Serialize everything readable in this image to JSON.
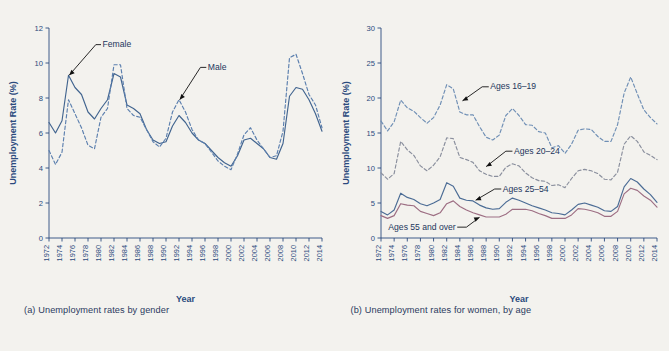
{
  "figure": {
    "background": "#f3f2ee",
    "axis_color": "#2b4a7d"
  },
  "panel_a": {
    "caption": "(a) Unemployment rates by gender",
    "ylabel": "Unemployment Rate (%)",
    "xlabel": "Year",
    "label_female": "Female",
    "label_male": "Male"
  },
  "panel_b": {
    "caption": "(b) Unemployment rates for women, by age",
    "ylabel": "Unemployment Rate (%)",
    "xlabel": "Year",
    "label_16_19": "Ages 16–19",
    "label_20_24": "Ages 20–24",
    "label_25_54": "Ages 25–54",
    "label_55_over": "Ages 55 and over"
  },
  "chart_data": [
    {
      "id": "panel_a",
      "type": "line",
      "title": "(a) Unemployment rates by gender",
      "xlabel": "Year",
      "ylabel": "Unemployment Rate (%)",
      "xlim": [
        1972,
        2014
      ],
      "ylim": [
        0,
        12
      ],
      "yticks": [
        0,
        2,
        4,
        6,
        8,
        10,
        12
      ],
      "xticks": [
        1972,
        1974,
        1976,
        1978,
        1980,
        1982,
        1984,
        1986,
        1988,
        1990,
        1992,
        1994,
        1996,
        1998,
        2000,
        2002,
        2004,
        2006,
        2008,
        2010,
        2012,
        2014
      ],
      "grid": false,
      "legend": "inline-annotations",
      "x": [
        1972,
        1973,
        1974,
        1975,
        1976,
        1977,
        1978,
        1979,
        1980,
        1981,
        1982,
        1983,
        1984,
        1985,
        1986,
        1987,
        1988,
        1989,
        1990,
        1991,
        1992,
        1993,
        1994,
        1995,
        1996,
        1997,
        1998,
        1999,
        2000,
        2001,
        2002,
        2003,
        2004,
        2005,
        2006,
        2007,
        2008,
        2009,
        2010,
        2011,
        2012,
        2013,
        2014
      ],
      "series": [
        {
          "name": "Female",
          "style": "solid",
          "color": "#41648f",
          "values": [
            6.6,
            6.0,
            6.7,
            9.3,
            8.6,
            8.2,
            7.2,
            6.8,
            7.4,
            7.9,
            9.4,
            9.2,
            7.6,
            7.4,
            7.1,
            6.2,
            5.6,
            5.4,
            5.5,
            6.4,
            7.0,
            6.6,
            6.0,
            5.6,
            5.4,
            5.0,
            4.6,
            4.3,
            4.1,
            4.7,
            5.6,
            5.7,
            5.4,
            5.1,
            4.6,
            4.5,
            5.4,
            8.1,
            8.6,
            8.5,
            7.9,
            7.1,
            6.1
          ]
        },
        {
          "name": "Male",
          "style": "dashed",
          "color": "#5b7fae",
          "values": [
            5.0,
            4.2,
            4.9,
            7.9,
            7.1,
            6.3,
            5.3,
            5.1,
            6.9,
            7.4,
            9.9,
            9.9,
            7.4,
            7.0,
            6.9,
            6.2,
            5.5,
            5.2,
            5.7,
            7.2,
            7.9,
            7.2,
            6.2,
            5.6,
            5.4,
            4.9,
            4.4,
            4.1,
            3.9,
            4.8,
            5.9,
            6.3,
            5.6,
            5.1,
            4.6,
            4.7,
            6.1,
            10.3,
            10.5,
            9.4,
            8.2,
            7.6,
            6.3
          ]
        }
      ]
    },
    {
      "id": "panel_b",
      "type": "line",
      "title": "(b) Unemployment rates for women, by age",
      "xlabel": "Year",
      "ylabel": "Unemployment Rate (%)",
      "xlim": [
        1972,
        2014
      ],
      "ylim": [
        0,
        30
      ],
      "yticks": [
        0,
        5,
        10,
        15,
        20,
        25,
        30
      ],
      "xticks": [
        1972,
        1974,
        1976,
        1978,
        1980,
        1982,
        1984,
        1986,
        1988,
        1990,
        1992,
        1994,
        1996,
        1998,
        2000,
        2002,
        2004,
        2006,
        2008,
        2010,
        2012,
        2014
      ],
      "grid": false,
      "legend": "inline-annotations",
      "x": [
        1972,
        1973,
        1974,
        1975,
        1976,
        1977,
        1978,
        1979,
        1980,
        1981,
        1982,
        1983,
        1984,
        1985,
        1986,
        1987,
        1988,
        1989,
        1990,
        1991,
        1992,
        1993,
        1994,
        1995,
        1996,
        1997,
        1998,
        1999,
        2000,
        2001,
        2002,
        2003,
        2004,
        2005,
        2006,
        2007,
        2008,
        2009,
        2010,
        2011,
        2012,
        2013,
        2014
      ],
      "series": [
        {
          "name": "Ages 16–19",
          "style": "dashed",
          "color": "#6f8fb5",
          "values": [
            16.7,
            15.3,
            16.6,
            19.7,
            18.6,
            18.1,
            17.2,
            16.4,
            17.2,
            19.0,
            21.9,
            21.3,
            18.0,
            17.6,
            17.6,
            15.9,
            14.4,
            14.0,
            14.7,
            17.5,
            18.5,
            17.5,
            16.2,
            16.1,
            15.2,
            15.0,
            12.9,
            13.2,
            12.1,
            13.4,
            15.4,
            15.6,
            15.5,
            14.5,
            13.8,
            13.8,
            16.2,
            20.7,
            23.0,
            20.6,
            18.3,
            17.2,
            16.3
          ]
        },
        {
          "name": "Ages 20–24",
          "style": "dashed",
          "color": "#8a8f9d",
          "values": [
            9.3,
            8.4,
            9.2,
            13.8,
            12.6,
            11.8,
            10.3,
            9.6,
            10.4,
            11.6,
            14.3,
            14.2,
            11.5,
            11.2,
            10.8,
            9.6,
            9.1,
            8.8,
            8.8,
            10.1,
            10.6,
            10.3,
            9.3,
            8.6,
            8.2,
            8.1,
            7.5,
            7.6,
            7.2,
            8.5,
            9.6,
            9.8,
            9.6,
            9.2,
            8.4,
            8.3,
            9.4,
            13.4,
            14.6,
            13.8,
            12.3,
            11.8,
            11.2
          ]
        },
        {
          "name": "Ages 25–54",
          "style": "solid",
          "color": "#4b6c95",
          "values": [
            3.8,
            3.3,
            4.0,
            6.4,
            5.8,
            5.5,
            4.9,
            4.6,
            5.0,
            5.5,
            7.9,
            7.4,
            5.7,
            5.4,
            5.3,
            4.7,
            4.3,
            4.1,
            4.2,
            5.1,
            5.7,
            5.4,
            5.0,
            4.6,
            4.3,
            4.0,
            3.6,
            3.5,
            3.3,
            4.0,
            4.8,
            5.0,
            4.7,
            4.4,
            3.9,
            3.8,
            4.5,
            7.3,
            8.5,
            8.0,
            7.0,
            6.2,
            5.1
          ]
        },
        {
          "name": "Ages 55 and over",
          "style": "solid",
          "color": "#9d6e83",
          "values": [
            3.2,
            2.8,
            3.2,
            4.9,
            4.7,
            4.6,
            3.8,
            3.5,
            3.2,
            3.6,
            4.9,
            5.3,
            4.5,
            4.0,
            3.6,
            3.3,
            3.0,
            3.0,
            3.0,
            3.4,
            4.1,
            4.1,
            4.1,
            3.9,
            3.5,
            3.2,
            2.8,
            2.8,
            2.8,
            3.3,
            4.2,
            4.1,
            3.9,
            3.6,
            3.1,
            3.1,
            3.8,
            6.3,
            7.1,
            6.8,
            6.0,
            5.4,
            4.4
          ]
        }
      ]
    }
  ]
}
